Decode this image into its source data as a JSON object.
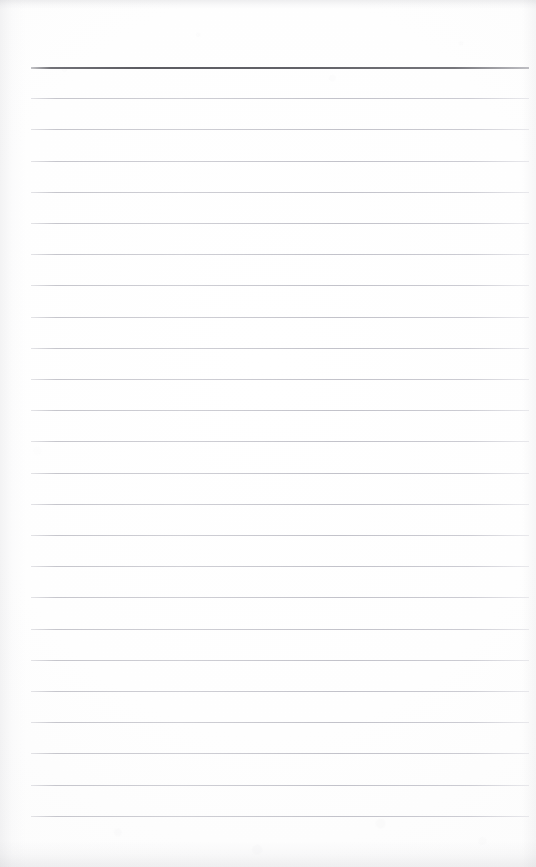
{
  "document": {
    "kind": "scanned-ruled-notepad-page",
    "title": "Blank Ruled Notepad Page",
    "content_text": "",
    "written_text": "",
    "page_width": 536,
    "page_height": 867
  },
  "paper": {
    "background_color": "#fdfdfc",
    "edge_shadow_color": "#a8a8b0",
    "has_visible_text": false,
    "has_margin_rule": false,
    "orientation": "portrait"
  },
  "ruling": {
    "line_start_x": 31,
    "line_end_x": 529,
    "first_line_y": 67,
    "line_spacing": 31.2,
    "header_rule_color": "#5c5c62",
    "header_rule_thickness": 2,
    "body_rule_color": "#c1c1c8",
    "body_rule_thickness": 1,
    "total_rules": 25,
    "body_rule_count": 24,
    "lines": [
      {
        "index": 0,
        "y": 67,
        "kind": "header",
        "content": ""
      },
      {
        "index": 1,
        "y": 98.2,
        "kind": "body",
        "content": ""
      },
      {
        "index": 2,
        "y": 129.4,
        "kind": "body",
        "content": ""
      },
      {
        "index": 3,
        "y": 160.6,
        "kind": "body",
        "content": ""
      },
      {
        "index": 4,
        "y": 191.8,
        "kind": "body",
        "content": ""
      },
      {
        "index": 5,
        "y": 223.0,
        "kind": "body",
        "content": ""
      },
      {
        "index": 6,
        "y": 254.2,
        "kind": "body",
        "content": ""
      },
      {
        "index": 7,
        "y": 285.4,
        "kind": "body",
        "content": ""
      },
      {
        "index": 8,
        "y": 316.6,
        "kind": "body",
        "content": ""
      },
      {
        "index": 9,
        "y": 347.8,
        "kind": "body",
        "content": ""
      },
      {
        "index": 10,
        "y": 379.0,
        "kind": "body",
        "content": ""
      },
      {
        "index": 11,
        "y": 410.2,
        "kind": "body",
        "content": ""
      },
      {
        "index": 12,
        "y": 441.4,
        "kind": "body",
        "content": ""
      },
      {
        "index": 13,
        "y": 472.6,
        "kind": "body",
        "content": ""
      },
      {
        "index": 14,
        "y": 503.8,
        "kind": "body",
        "content": ""
      },
      {
        "index": 15,
        "y": 535.0,
        "kind": "body",
        "content": ""
      },
      {
        "index": 16,
        "y": 566.2,
        "kind": "body",
        "content": ""
      },
      {
        "index": 17,
        "y": 597.4,
        "kind": "body",
        "content": ""
      },
      {
        "index": 18,
        "y": 628.6,
        "kind": "body",
        "content": ""
      },
      {
        "index": 19,
        "y": 659.8,
        "kind": "body",
        "content": ""
      },
      {
        "index": 20,
        "y": 691.0,
        "kind": "body",
        "content": ""
      },
      {
        "index": 21,
        "y": 722.2,
        "kind": "body",
        "content": ""
      },
      {
        "index": 22,
        "y": 753.4,
        "kind": "body",
        "content": ""
      },
      {
        "index": 23,
        "y": 784.6,
        "kind": "body",
        "content": ""
      },
      {
        "index": 24,
        "y": 815.8,
        "kind": "body",
        "content": ""
      }
    ]
  }
}
